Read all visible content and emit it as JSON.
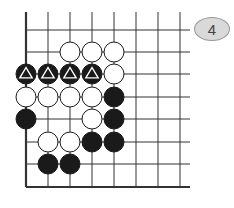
{
  "diagram": {
    "label": "4",
    "grid": {
      "x_lines": [
        26,
        48,
        70,
        92,
        114,
        136,
        158,
        180
      ],
      "y_lines": [
        30,
        52,
        74,
        97,
        119,
        142,
        164,
        187
      ],
      "top_extend": 18,
      "right_extend": 10,
      "left_edge": true,
      "bottom_edge": true
    },
    "stone_radius": 10,
    "colors": {
      "black": "#1a1a1a",
      "white": "#ffffff",
      "line": "#333333"
    },
    "stones": [
      {
        "col": 2,
        "row": 1,
        "color": "white"
      },
      {
        "col": 3,
        "row": 1,
        "color": "white"
      },
      {
        "col": 4,
        "row": 1,
        "color": "white"
      },
      {
        "col": 0,
        "row": 2,
        "color": "black",
        "mark": "triangle"
      },
      {
        "col": 1,
        "row": 2,
        "color": "black",
        "mark": "triangle"
      },
      {
        "col": 2,
        "row": 2,
        "color": "black",
        "mark": "triangle"
      },
      {
        "col": 3,
        "row": 2,
        "color": "black",
        "mark": "triangle"
      },
      {
        "col": 4,
        "row": 2,
        "color": "white"
      },
      {
        "col": 0,
        "row": 3,
        "color": "white"
      },
      {
        "col": 1,
        "row": 3,
        "color": "white"
      },
      {
        "col": 2,
        "row": 3,
        "color": "white"
      },
      {
        "col": 3,
        "row": 3,
        "color": "white"
      },
      {
        "col": 4,
        "row": 3,
        "color": "black"
      },
      {
        "col": 0,
        "row": 4,
        "color": "black"
      },
      {
        "col": 3,
        "row": 4,
        "color": "white"
      },
      {
        "col": 4,
        "row": 4,
        "color": "black"
      },
      {
        "col": 1,
        "row": 5,
        "color": "white"
      },
      {
        "col": 2,
        "row": 5,
        "color": "white"
      },
      {
        "col": 3,
        "row": 5,
        "color": "black"
      },
      {
        "col": 4,
        "row": 5,
        "color": "black"
      },
      {
        "col": 1,
        "row": 6,
        "color": "black"
      },
      {
        "col": 2,
        "row": 6,
        "color": "black"
      }
    ]
  }
}
